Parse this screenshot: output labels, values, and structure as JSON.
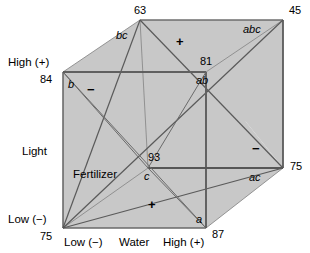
{
  "figure": {
    "type": "cube-plot",
    "colors": {
      "shaded_fill": "#c9c9c9",
      "line": "#555555",
      "heavy_line": "#333333",
      "text": "#000000",
      "background": "#ffffff"
    }
  },
  "axes": {
    "vertical": {
      "name": "Light",
      "low_label": "Low (−)",
      "high_label": "High (+)"
    },
    "horizontal": {
      "name": "Water",
      "low_label": "Low (−)",
      "high_label": "High (+)"
    },
    "depth": {
      "name": "Fertilizer"
    }
  },
  "corners": [
    {
      "id": "low-low-low",
      "value": "75",
      "effect": "(1)",
      "effect_shown": "",
      "sign": "+"
    },
    {
      "id": "a-corner",
      "value": "87",
      "effect": "a",
      "effect_shown": "a",
      "sign": ""
    },
    {
      "id": "b-corner",
      "value": "84",
      "effect": "b",
      "effect_shown": "b",
      "sign": ""
    },
    {
      "id": "ab-corner",
      "value": "81",
      "effect": "ab",
      "effect_shown": "ab",
      "sign": ""
    },
    {
      "id": "c-corner",
      "value": "93",
      "effect": "c",
      "effect_shown": "c",
      "sign": ""
    },
    {
      "id": "ac-corner",
      "value": "75",
      "effect": "ac",
      "effect_shown": "ac",
      "sign": ""
    },
    {
      "id": "bc-corner",
      "value": "63",
      "effect": "bc",
      "effect_shown": "bc",
      "sign": ""
    },
    {
      "id": "abc-corner",
      "value": "45",
      "effect": "abc",
      "effect_shown": "abc",
      "sign": ""
    }
  ],
  "labels": {
    "value_63": "63",
    "value_45": "45",
    "value_84": "84",
    "value_81": "81",
    "value_93": "93",
    "value_75_right": "75",
    "value_75_bottomleft": "75",
    "value_87": "87",
    "effect_bc": "bc",
    "effect_abc": "abc",
    "effect_b": "b",
    "effect_ab": "ab",
    "effect_c": "c",
    "effect_ac": "ac",
    "effect_a": "a",
    "axis_light": "Light",
    "axis_water": "Water",
    "axis_fertilizer": "Fertilizer",
    "light_high": "High (+)",
    "light_low": "Low (−)",
    "water_low": "Low (−)",
    "water_high": "High (+)",
    "sign_plus_top": "+",
    "sign_minus_left": "−",
    "sign_minus_right": "−",
    "sign_plus_bottom": "+"
  }
}
